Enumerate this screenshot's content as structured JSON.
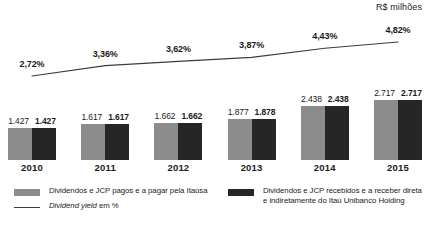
{
  "unit_caption": "R$ milhões",
  "legend": {
    "paid": {
      "swatch": "gray-swatch",
      "label": "Dividendos e JCP pagos e a pagar pela Itaúsa"
    },
    "received": {
      "swatch": "dark-swatch",
      "label_line1": "Dividendos e JCP recebidos e a receber direta",
      "label_line2": "e indiretamente do Itaú Unibanco Holding"
    },
    "yield": {
      "swatch": "line-swatch",
      "label_italic": "Dividend yield",
      "label_rest": " em %"
    }
  },
  "colors": {
    "bar_paid": "#8c8c8c",
    "bar_received": "#262626",
    "line": "#3c3c3c",
    "text": "#1a1a1a",
    "background": "#ffffff"
  },
  "chart_data": {
    "type": "bar",
    "title": "",
    "subtitle": "",
    "xlabel": "",
    "ylabel": "R$ milhões",
    "grid": false,
    "legend_position": "bottom",
    "categories": [
      "2010",
      "2011",
      "2012",
      "2013",
      "2014",
      "2015"
    ],
    "series": [
      {
        "name": "Dividendos e JCP pagos e a pagar pela Itaúsa",
        "type": "bar",
        "color": "#8c8c8c",
        "values": [
          1427,
          1617,
          1662,
          1877,
          2438,
          2717
        ],
        "labels": [
          "1.427",
          "1.617",
          "1.662",
          "1.877",
          "2.438",
          "2.717"
        ]
      },
      {
        "name": "Dividendos e JCP recebidos e a receber direta e indiretamente do Itaú Unibanco Holding",
        "type": "bar",
        "color": "#262626",
        "values": [
          1427,
          1617,
          1662,
          1878,
          2438,
          2717
        ],
        "labels": [
          "1.427",
          "1.617",
          "1.662",
          "1.878",
          "2.438",
          "2.717"
        ]
      },
      {
        "name": "Dividend yield em %",
        "type": "line",
        "color": "#3c3c3c",
        "values": [
          2.72,
          3.36,
          3.62,
          3.87,
          4.43,
          4.82
        ],
        "labels": [
          "2,72%",
          "3,36%",
          "3,62%",
          "3,87%",
          "4,43%",
          "4,82%"
        ]
      }
    ],
    "ylim": [
      0,
      3000
    ],
    "yield_lim": [
      0,
      5.6
    ]
  }
}
